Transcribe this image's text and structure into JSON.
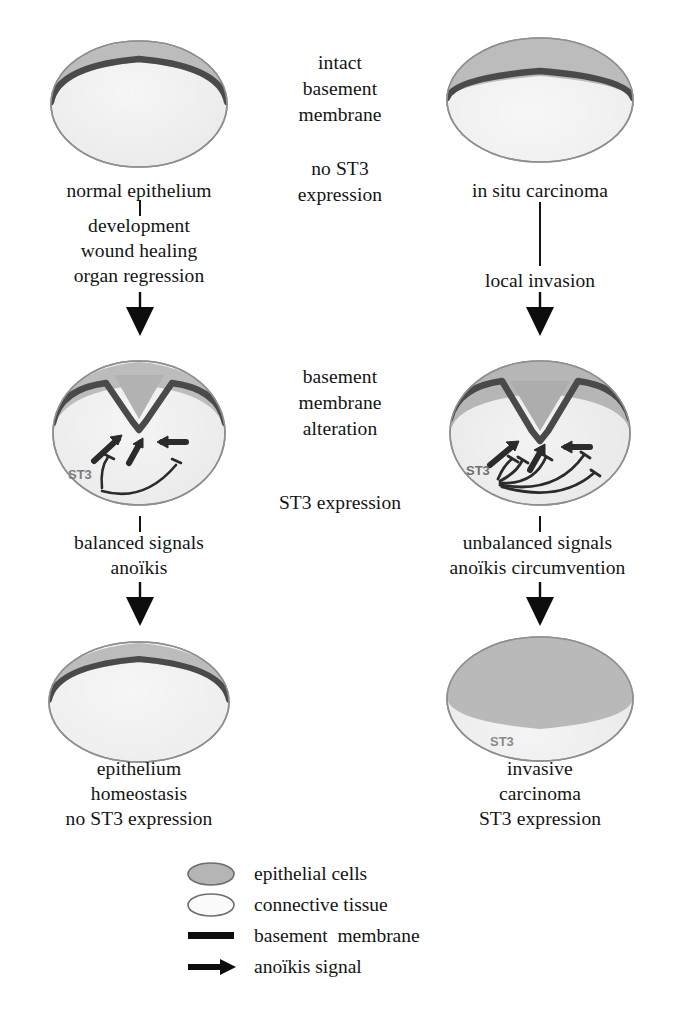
{
  "colors": {
    "epithelium_fill": "#b9b9b9",
    "epithelium_fill_dark": "#ababab",
    "connective_fill": "#f0f0f0",
    "basement_membrane": "#3d3d3d",
    "outline": "#8a8a8a",
    "arrow": "#0d0d0d",
    "text": "#141414",
    "st3_label": "#7c7c7c"
  },
  "left_column": {
    "name": "normal-epithelium-pathway",
    "cells": [
      {
        "id": "normal-epithelium",
        "caption": "normal epithelium",
        "st3_label": "",
        "state": "intact basement membrane, thin epithelial layer"
      },
      {
        "id": "remodelling-epithelium",
        "caption": "",
        "st3_label": "ST3",
        "state": "basement membrane notched, balanced anoikis signals"
      },
      {
        "id": "homeostatic-epithelium",
        "caption": "epithelium\nhomeostasis\nno ST3 expression",
        "st3_label": "",
        "state": "restored intact basement membrane"
      }
    ],
    "transitions": [
      {
        "id": "development-transition",
        "label": "development\nwound healing\norgan regression"
      },
      {
        "id": "balanced-signals-transition",
        "label": "balanced signals\nanoïkis"
      }
    ]
  },
  "right_column": {
    "name": "carcinoma-pathway",
    "cells": [
      {
        "id": "in-situ-carcinoma",
        "caption": "in situ carcinoma",
        "st3_label": "",
        "state": "thick epithelial layer, intact basement membrane"
      },
      {
        "id": "invading-carcinoma",
        "caption": "",
        "st3_label": "ST3",
        "state": "basement membrane breached, multiple unbalanced signals"
      },
      {
        "id": "invasive-carcinoma",
        "caption": "invasive\ncarcinoma\nST3 expression",
        "st3_label": "ST3",
        "state": "epithelial cells fill the tissue, basement membrane lost"
      }
    ],
    "transitions": [
      {
        "id": "local-invasion-transition",
        "label": "local invasion"
      },
      {
        "id": "unbalanced-signals-transition",
        "label": "unbalanced signals\nanoïkis circumvention"
      }
    ]
  },
  "center_column": {
    "name": "shared-annotations",
    "blocks": [
      {
        "id": "intact-bm-note",
        "text": "intact\nbasement\nmembrane"
      },
      {
        "id": "no-st3-note",
        "text": "no ST3\nexpression"
      },
      {
        "id": "bm-alteration-note",
        "text": "basement\nmembrane\nalteration"
      },
      {
        "id": "st3-expression-note",
        "text": "ST3 expression"
      }
    ]
  },
  "legend": {
    "name": "figure-legend",
    "items": [
      {
        "key": "epithelial-cells-swatch",
        "label": "epithelial cells"
      },
      {
        "key": "connective-tissue-swatch",
        "label": "connective tissue"
      },
      {
        "key": "basement-membrane-swatch",
        "label": "basement  membrane"
      },
      {
        "key": "anoikis-signal-swatch",
        "label": "anoïkis signal"
      }
    ]
  }
}
